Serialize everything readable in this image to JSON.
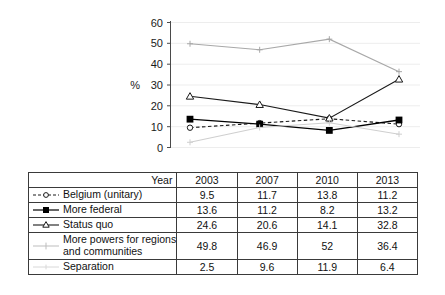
{
  "chart_data": {
    "type": "line",
    "title": "",
    "xlabel": "Year",
    "ylabel": "%",
    "ylim": [
      0,
      60
    ],
    "ytick_step": 10,
    "yticks": [
      "0",
      "10",
      "20",
      "30",
      "40",
      "50",
      "60"
    ],
    "categories": [
      "2003",
      "2007",
      "2010",
      "2013"
    ],
    "grid": "horizontal-faint",
    "legend_position": "table-row-labels",
    "series": [
      {
        "name": "Belgium (unitary)",
        "values": [
          9.5,
          11.7,
          13.8,
          11.2
        ],
        "marker": "open-circle",
        "line": "dashed",
        "color": "#1a1a1a"
      },
      {
        "name": "More federal",
        "values": [
          13.6,
          11.2,
          8.2,
          13.2
        ],
        "marker": "filled-square",
        "line": "solid",
        "color": "#000000"
      },
      {
        "name": "Status quo",
        "values": [
          24.6,
          20.6,
          14.1,
          32.8
        ],
        "marker": "open-triangle",
        "line": "solid",
        "color": "#1a1a1a"
      },
      {
        "name": "More powers for regions and communities",
        "values": [
          49.8,
          46.9,
          52,
          36.4
        ],
        "marker": "plus",
        "line": "solid",
        "color": "#a8a8a8"
      },
      {
        "name": "Separation",
        "values": [
          2.5,
          9.6,
          11.9,
          6.4
        ],
        "marker": "plus",
        "line": "solid",
        "color": "#cfcfcf"
      }
    ]
  },
  "axis": {
    "y_unit": "%",
    "y_ticks": [
      "60",
      "50",
      "40",
      "30",
      "20",
      "10",
      "0"
    ]
  },
  "table": {
    "header": {
      "label": "Year",
      "years": [
        "2003",
        "2007",
        "2010",
        "2013"
      ]
    },
    "rows": [
      {
        "label": "Belgium (unitary)",
        "marker": "dashed-open-circle-marker",
        "values": [
          "9.5",
          "11.7",
          "13.8",
          "11.2"
        ]
      },
      {
        "label": "More federal",
        "marker": "solid-filled-square-marker",
        "values": [
          "13.6",
          "11.2",
          "8.2",
          "13.2"
        ]
      },
      {
        "label": "Status quo",
        "marker": "solid-open-triangle-marker",
        "values": [
          "24.6",
          "20.6",
          "14.1",
          "32.8"
        ]
      },
      {
        "label": "More powers for regions and communities",
        "label_line1": "More powers for regions",
        "label_line2": "and communities",
        "marker": "faint-plus-marker",
        "values": [
          "49.8",
          "46.9",
          "52",
          "36.4"
        ]
      },
      {
        "label": "Separation",
        "marker": "faint-line-marker",
        "values": [
          "2.5",
          "9.6",
          "11.9",
          "6.4"
        ]
      }
    ]
  }
}
